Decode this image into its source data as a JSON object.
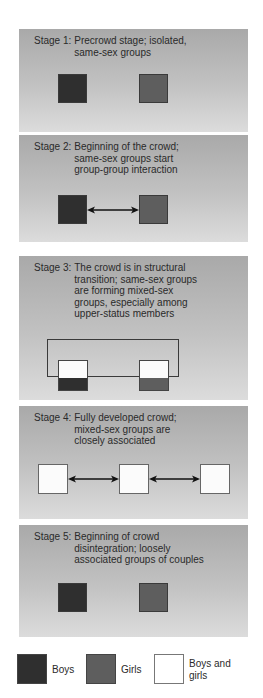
{
  "stages": [
    {
      "label": "Stage 1:",
      "description": "Precrowd stage; isolated,\nsame-sex groups"
    },
    {
      "label": "Stage 2:",
      "description": "Beginning of the crowd;\nsame-sex groups start\ngroup-group interaction"
    },
    {
      "label": "Stage 3:",
      "description": "The crowd is in structural\ntransition; same-sex groups\nare forming mixed-sex\ngroups, especially among\nupper-status members"
    },
    {
      "label": "Stage 4:",
      "description": "Fully developed crowd;\nmixed-sex groups are\nclosely associated"
    },
    {
      "label": "Stage 5:",
      "description": "Beginning of crowd\ndisintegration; loosely\nassociated groups of couples"
    }
  ],
  "legend": {
    "boys": "Boys",
    "girls": "Girls",
    "mixed": "Boys and\ngirls"
  },
  "colors": {
    "boys": "#2f2f2f",
    "girls": "#5e5e5e",
    "mixed": "#fbfbfb",
    "panel_top": "#a9a9a9",
    "panel_bottom": "#dcdcdc"
  }
}
